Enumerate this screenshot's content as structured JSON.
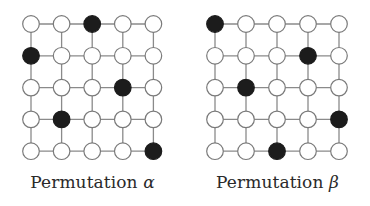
{
  "figure": {
    "panels": [
      {
        "id": "alpha",
        "caption_text": "Permutation",
        "caption_symbol": "α",
        "grid_size": 5,
        "filled": [
          [
            0,
            2
          ],
          [
            1,
            0
          ],
          [
            2,
            3
          ],
          [
            3,
            1
          ],
          [
            4,
            4
          ]
        ],
        "permutation": [
          3,
          1,
          4,
          2,
          5
        ]
      },
      {
        "id": "beta",
        "caption_text": "Permutation",
        "caption_symbol": "β",
        "grid_size": 5,
        "filled": [
          [
            0,
            0
          ],
          [
            1,
            3
          ],
          [
            2,
            1
          ],
          [
            3,
            4
          ],
          [
            4,
            2
          ]
        ],
        "permutation": [
          1,
          4,
          2,
          5,
          3
        ]
      }
    ],
    "colors": {
      "line": "#8a8a8a",
      "node_stroke": "#7a7a7a",
      "node_empty": "#ffffff",
      "node_filled": "#1c1c1c",
      "text": "#2a2a2a"
    }
  }
}
